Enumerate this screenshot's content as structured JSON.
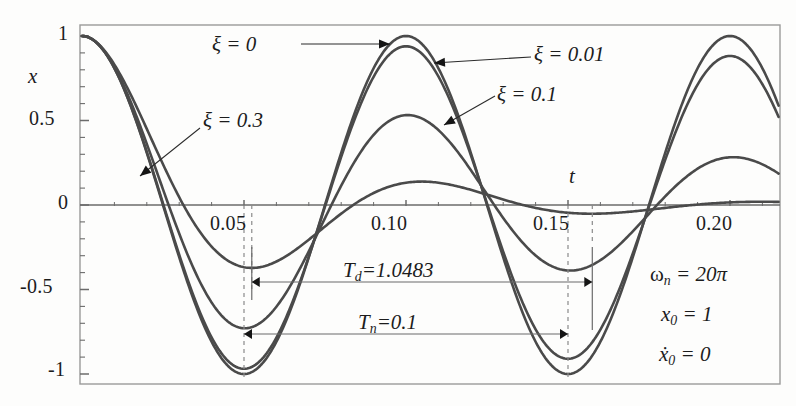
{
  "figure": {
    "axis_labels": {
      "x": "t",
      "y": "x"
    },
    "y_ticks": [
      "1",
      "0.5",
      "0",
      "-0.5",
      "-1"
    ],
    "y_tick_values": [
      1,
      0.5,
      0,
      -0.5,
      -1
    ],
    "x_ticks": [
      "0.05",
      "0.10",
      "0.15",
      "0.20"
    ],
    "x_tick_values": [
      0.05,
      0.1,
      0.15,
      0.2
    ],
    "curve_labels": [
      {
        "id": "zeta-0",
        "text": "ξ = 0"
      },
      {
        "id": "zeta-001",
        "text": "ξ = 0.01"
      },
      {
        "id": "zeta-01",
        "text": "ξ = 0.1"
      },
      {
        "id": "zeta-03",
        "text": "ξ = 0.3"
      }
    ],
    "measure_labels": [
      {
        "id": "Td",
        "sym": "T",
        "subs": "d",
        "value": "=1.0483"
      },
      {
        "id": "Tn",
        "sym": "T",
        "subs": "n",
        "value": "=0.1"
      }
    ],
    "params": [
      {
        "id": "omega-n",
        "sym": "ω",
        "subs": "n",
        "value": "= 20π"
      },
      {
        "id": "x0",
        "sym": "x",
        "subs": "0",
        "value": "= 1"
      },
      {
        "id": "x0dot",
        "sym": "ẋ",
        "subs": "0",
        "value": "= 0"
      }
    ],
    "colors": {
      "curve": "#4a4a4a",
      "axis": "#6b6b6b",
      "frame": "#9a9a9a",
      "dashed": "#8a8a8a",
      "text": "#1c1c1c"
    }
  },
  "chart_data": {
    "type": "line",
    "title": "",
    "xlabel": "t",
    "ylabel": "x",
    "xlim": [
      0,
      0.215
    ],
    "ylim": [
      -1.08,
      1.08
    ],
    "grid": false,
    "legend": "inline-annotations",
    "model": {
      "omega_n": 62.8318530718,
      "omega_n_text": "20π",
      "x0": 1,
      "x0_dot": 0,
      "T_n": 0.1,
      "T_d_label": 1.0483
    },
    "x_sample_start": 0,
    "x_sample_end": 0.215,
    "x_sample_step": 0.0005,
    "series": [
      {
        "name": "ξ = 0",
        "zeta": 0,
        "color": "#4a4a4a"
      },
      {
        "name": "ξ = 0.01",
        "zeta": 0.01,
        "color": "#4a4a4a"
      },
      {
        "name": "ξ = 0.1",
        "zeta": 0.1,
        "color": "#4a4a4a"
      },
      {
        "name": "ξ = 0.3",
        "zeta": 0.3,
        "color": "#4a4a4a"
      }
    ],
    "key_points": {
      "peaks_zeta0": [
        {
          "t": 0.0,
          "x": 1.0
        },
        {
          "t": 0.1,
          "x": 1.0
        },
        {
          "t": 0.2,
          "x": 1.0
        }
      ],
      "troughs_zeta0": [
        {
          "t": 0.05,
          "x": -1.0
        },
        {
          "t": 0.15,
          "x": -1.0
        }
      ],
      "troughs_zeta01": [
        {
          "t": 0.05,
          "x": -0.73
        },
        {
          "t": 0.15,
          "x": -0.39
        }
      ],
      "troughs_zeta03": [
        {
          "t": 0.052,
          "x": -0.37
        },
        {
          "t": 0.157,
          "x": -0.135
        }
      ],
      "peaks_zeta01": [
        {
          "t": 0.1,
          "x": 0.53
        },
        {
          "t": 0.2,
          "x": 0.28
        }
      ],
      "peaks_zeta03": [
        {
          "t": 0.105,
          "x": 0.14
        }
      ]
    }
  }
}
